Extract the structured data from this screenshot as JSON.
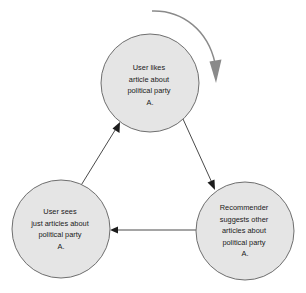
{
  "diagram": {
    "type": "cycle-diagram",
    "colors": {
      "node_fill": "#e5e5e5",
      "node_stroke": "#6f6f6f",
      "edge": "#4a4a4a",
      "loop_arrow": "#8a8a8a",
      "text": "#1a1a1a",
      "background": "#ffffff"
    },
    "nodes": [
      {
        "id": "user-likes",
        "position": "top",
        "cx": 150,
        "cy": 83,
        "r": 49,
        "lines": [
          "User likes",
          "article about",
          "political party",
          "A."
        ]
      },
      {
        "id": "recommender-suggests",
        "position": "bottom-right",
        "cx": 245,
        "cy": 231,
        "r": 49,
        "lines": [
          "Recommender",
          "suggests other",
          "articles about",
          "political party",
          "A."
        ]
      },
      {
        "id": "user-sees",
        "position": "bottom-left",
        "cx": 61,
        "cy": 229,
        "r": 49,
        "lines": [
          "User sees",
          "just articles about",
          "political party",
          "A."
        ]
      }
    ],
    "edges": [
      {
        "id": "edge-likes-to-recommender",
        "from": "user-likes",
        "to": "recommender-suggests",
        "direction": "down-right"
      },
      {
        "id": "edge-recommender-to-sees",
        "from": "recommender-suggests",
        "to": "user-sees",
        "direction": "left"
      },
      {
        "id": "edge-sees-to-likes",
        "from": "user-sees",
        "to": "user-likes",
        "direction": "up-right"
      }
    ],
    "loop_arrow": {
      "id": "cycle-loop-arrow",
      "label": "clockwise cycle indicator",
      "direction": "clockwise"
    }
  }
}
